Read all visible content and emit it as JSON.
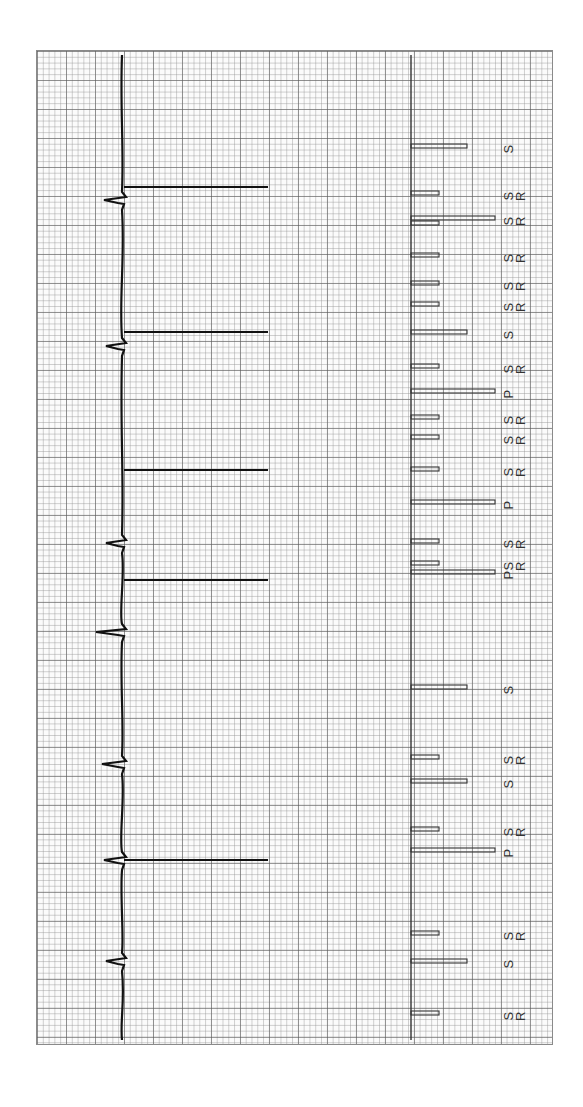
{
  "chart_data": {
    "type": "line",
    "title": "",
    "orientation": "rotated-90",
    "grid": {
      "on": true,
      "major_px": 29,
      "minor_px": 5.8
    },
    "ecg": {
      "baseline_x": 122,
      "beats": [
        {
          "y": 200,
          "depth": 18,
          "paced_spike_to_x": 268,
          "spike_y": 187
        },
        {
          "y": 346,
          "depth": 16,
          "paced_spike_to_x": 268,
          "spike_y": 332
        },
        {
          "y": 543,
          "depth": 16,
          "paced_spike_to_x": null,
          "spike_y": null
        },
        {
          "y": 632,
          "depth": 26,
          "paced_spike_to_x": null,
          "spike_y": null
        },
        {
          "y": 764,
          "depth": 20,
          "paced_spike_to_x": null,
          "spike_y": null
        },
        {
          "y": 860,
          "depth": 18,
          "paced_spike_to_x": 268,
          "spike_y": 860
        },
        {
          "y": 961,
          "depth": 16,
          "paced_spike_to_x": null,
          "spike_y": null
        }
      ],
      "extra_spikes": [
        {
          "y": 470,
          "to_x": 268
        },
        {
          "y": 580,
          "to_x": 268
        }
      ]
    },
    "markers": {
      "baseline_x": 411,
      "items": [
        {
          "y": 146,
          "length": "medium",
          "label": "S"
        },
        {
          "y": 193,
          "length": "short",
          "label": "SR"
        },
        {
          "y": 218,
          "length": "long",
          "label": "SR"
        },
        {
          "y": 223,
          "length": "short",
          "label": ""
        },
        {
          "y": 255,
          "length": "short",
          "label": "SR"
        },
        {
          "y": 283,
          "length": "short",
          "label": "SR"
        },
        {
          "y": 304,
          "length": "short",
          "label": "SR"
        },
        {
          "y": 332,
          "length": "medium",
          "label": "S"
        },
        {
          "y": 366,
          "length": "short",
          "label": "SR"
        },
        {
          "y": 391,
          "length": "long",
          "label": "P"
        },
        {
          "y": 417,
          "length": "short",
          "label": "SR"
        },
        {
          "y": 437,
          "length": "short",
          "label": "SR"
        },
        {
          "y": 469,
          "length": "short",
          "label": "SR"
        },
        {
          "y": 502,
          "length": "long",
          "label": "P"
        },
        {
          "y": 541,
          "length": "short",
          "label": "SR"
        },
        {
          "y": 563,
          "length": "short",
          "label": "SR"
        },
        {
          "y": 572,
          "length": "long",
          "label": "P"
        },
        {
          "y": 687,
          "length": "medium",
          "label": "S"
        },
        {
          "y": 757,
          "length": "short",
          "label": "SR"
        },
        {
          "y": 781,
          "length": "medium",
          "label": "S"
        },
        {
          "y": 829,
          "length": "short",
          "label": "SR"
        },
        {
          "y": 850,
          "length": "long",
          "label": "P"
        },
        {
          "y": 933,
          "length": "short",
          "label": "SR"
        },
        {
          "y": 961,
          "length": "medium",
          "label": "S"
        },
        {
          "y": 1013,
          "length": "short",
          "label": "SR"
        }
      ],
      "lengths_px": {
        "short": 28,
        "medium": 56,
        "long": 84
      },
      "legend": {
        "S": "Sensed",
        "SR": "Sensed (refractory)",
        "P": "Paced"
      }
    },
    "xlabel": "",
    "ylabel": ""
  },
  "colors": {
    "trace": "#111111",
    "marker": "#333333",
    "grid_major": "#5a5a5a",
    "grid_minor": "#969696"
  }
}
